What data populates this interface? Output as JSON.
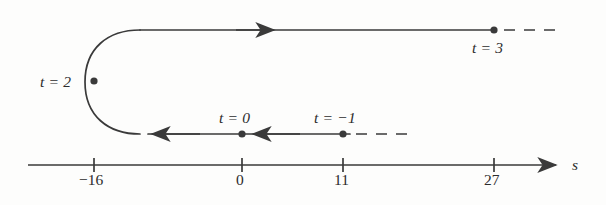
{
  "figure": {
    "stroke_color": "#3a3a3a",
    "background_color": "#fdfdfc",
    "axis_name": "s"
  },
  "axis": {
    "label": "s",
    "ticks": [
      {
        "label": "−16",
        "value": -16,
        "x": 94
      },
      {
        "label": "0",
        "value": 0,
        "x": 242
      },
      {
        "label": "11",
        "value": 11,
        "x": 343
      },
      {
        "label": "27",
        "value": 27,
        "x": 494
      }
    ],
    "start_x": 28,
    "end_x": 556,
    "y": 165,
    "arrow_direction": "right"
  },
  "path_labels": {
    "t2": "t = 2",
    "t3": "t = 3",
    "t0": "t = 0",
    "tm1": "t = −1"
  },
  "markers": [
    {
      "name": "marker-t2",
      "label": "t = 2",
      "t": 2,
      "s": -16,
      "x": 94,
      "y": 81
    },
    {
      "name": "marker-t3",
      "label": "t = 3",
      "t": 3,
      "s": 27,
      "x": 494,
      "y": 30
    },
    {
      "name": "marker-t0",
      "label": "t = 0",
      "t": 0,
      "s": 0,
      "x": 242,
      "y": 134
    },
    {
      "name": "marker-tm1",
      "label": "t = −1",
      "t": -1,
      "s": 11,
      "x": 343,
      "y": 134
    }
  ],
  "branches": [
    {
      "name": "upper-branch",
      "description": "motion in the +s direction toward t = 3",
      "direction": "right",
      "y": 30,
      "solid_from_x": 140,
      "solid_to_x": 494,
      "dashed_from_x": 504,
      "dashed_to_x": 556,
      "arrow_x": 270
    },
    {
      "name": "lower-branch",
      "description": "motion in the −s direction from t = −1 through t = 0 toward the turning point",
      "direction": "left",
      "y": 134,
      "solid_from_x": 150,
      "solid_to_x": 350,
      "dashed_from_x": 356,
      "dashed_to_x": 412,
      "arrow_x_first": 162,
      "arrow_x_second": 262
    },
    {
      "name": "turnaround-curve",
      "description": "U-turn at s = −16 where the particle reverses direction at t = 2",
      "apex_x": 85,
      "top_y": 30,
      "bottom_y": 134
    }
  ]
}
